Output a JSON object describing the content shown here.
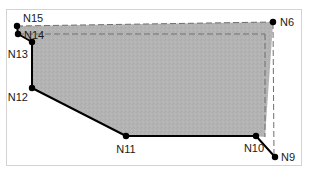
{
  "figure": {
    "background_color": "#ffffff",
    "frame_color": "#d3d3d3",
    "fill_color": "#b3b3b3",
    "solid_stroke_color": "#000000",
    "dashed_stroke_color": "#6e6e6e",
    "node_color": "#000000",
    "width": 311,
    "height": 178
  },
  "nodes": [
    {
      "id": "N15",
      "label": "N15",
      "x": 17,
      "y": 26,
      "label_x": 23,
      "label_y": 22,
      "label_anchor": "start"
    },
    {
      "id": "N14",
      "label": "N14",
      "x": 18,
      "y": 34,
      "label_x": 24,
      "label_y": 39,
      "label_anchor": "start"
    },
    {
      "id": "N13",
      "label": "N13",
      "x": 32,
      "y": 42,
      "label_x": 28,
      "label_y": 58,
      "label_anchor": "end"
    },
    {
      "id": "N12",
      "label": "N12",
      "x": 32,
      "y": 88,
      "label_x": 28,
      "label_y": 101,
      "label_anchor": "end"
    },
    {
      "id": "N11",
      "label": "N11",
      "x": 126,
      "y": 136,
      "label_x": 126,
      "label_y": 153,
      "label_anchor": "middle"
    },
    {
      "id": "N10",
      "label": "N10",
      "x": 256,
      "y": 136,
      "label_x": 254,
      "label_y": 152,
      "label_anchor": "middle"
    },
    {
      "id": "N9",
      "label": "N9",
      "x": 275,
      "y": 157,
      "label_x": 281,
      "label_y": 161,
      "label_anchor": "start"
    },
    {
      "id": "N6",
      "label": "N6",
      "x": 273,
      "y": 22,
      "label_x": 280,
      "label_y": 26,
      "label_anchor": "start"
    }
  ],
  "region": {
    "name": "shaded-polygon",
    "points": "17,26 273,22 273,24 265,137 256,136 126,136 32,88 32,42 18,34"
  },
  "solid_edges": [
    {
      "name": "edge-n15-n14",
      "x1": 17,
      "y1": 26,
      "x2": 18,
      "y2": 34
    },
    {
      "name": "edge-n14-n13",
      "x1": 18,
      "y1": 34,
      "x2": 32,
      "y2": 42
    },
    {
      "name": "edge-n13-n12",
      "x1": 32,
      "y1": 42,
      "x2": 32,
      "y2": 88
    },
    {
      "name": "edge-n12-n11",
      "x1": 32,
      "y1": 88,
      "x2": 126,
      "y2": 136
    },
    {
      "name": "edge-n11-n10",
      "x1": 126,
      "y1": 136,
      "x2": 256,
      "y2": 136
    },
    {
      "name": "edge-n10-n9",
      "x1": 256,
      "y1": 136,
      "x2": 275,
      "y2": 157
    }
  ],
  "dashed_edges": [
    {
      "name": "dashed-top-n15-n6",
      "x1": 17,
      "y1": 26,
      "x2": 273,
      "y2": 22
    },
    {
      "name": "dashed-right-n6-n9",
      "x1": 273,
      "y1": 23,
      "x2": 274,
      "y2": 156
    },
    {
      "name": "dashed-inner-top",
      "x1": 18,
      "y1": 34,
      "x2": 265,
      "y2": 34
    },
    {
      "name": "dashed-inner-right",
      "x1": 265,
      "y1": 34,
      "x2": 265,
      "y2": 137
    }
  ],
  "dash_pattern": "6 3"
}
